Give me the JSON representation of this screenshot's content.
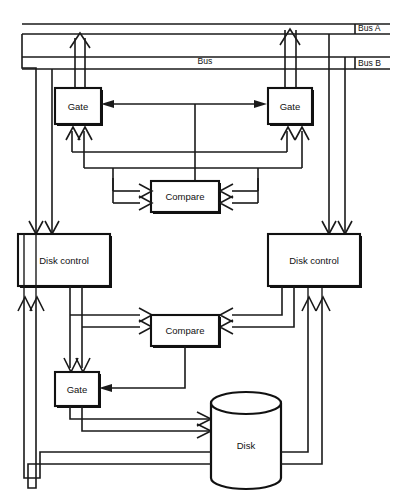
{
  "diagram": {
    "colors": {
      "line": "#1a1a1a",
      "box_border": "#111111",
      "background": "#ffffff",
      "text": "#111111"
    },
    "bus_labels": [
      {
        "id": "bus-a",
        "text": "Bus A"
      },
      {
        "id": "bus-b",
        "text": "Bus B"
      },
      {
        "id": "bus-mid",
        "text": "Bus"
      }
    ],
    "blocks": [
      {
        "id": "gate-top-left",
        "label": "Gate"
      },
      {
        "id": "gate-top-right",
        "label": "Gate"
      },
      {
        "id": "compare-top",
        "label": "Compare"
      },
      {
        "id": "disk-control-left",
        "label": "Disk control"
      },
      {
        "id": "disk-control-right",
        "label": "Disk control"
      },
      {
        "id": "compare-bottom",
        "label": "Compare"
      },
      {
        "id": "gate-bottom-left",
        "label": "Gate"
      },
      {
        "id": "disk",
        "label": "Disk"
      }
    ]
  }
}
